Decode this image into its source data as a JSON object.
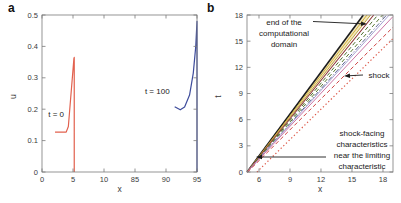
{
  "figure": {
    "axis_color": "#7a7a7a",
    "tick_label_color": "#3a3a3a",
    "annotation_color": "#1a1a1a"
  },
  "chart_data": [
    {
      "id": "panel-a",
      "panel_label": "a",
      "type": "line",
      "xlabel": "x",
      "ylabel": "u",
      "x_axis": {
        "broken": true,
        "tick_values": [
          0,
          5,
          10,
          85,
          90,
          95
        ],
        "tick_labels": [
          "0",
          "5",
          "10",
          "85",
          "90",
          "95"
        ],
        "note": "axis break between 10 and 85, ticks evenly spaced"
      },
      "y_axis": {
        "range": [
          0,
          0.5
        ],
        "tick_values": [
          0,
          0.1,
          0.2,
          0.3,
          0.4,
          0.5
        ],
        "tick_labels": [
          "0",
          "0.1",
          "0.2",
          "0.3",
          "0.4",
          "0.5"
        ]
      },
      "series": [
        {
          "name": "profile-t0",
          "color": "#e2614e",
          "width": 1.2,
          "points": [
            [
              2.1,
              0.127
            ],
            [
              3.9,
              0.127
            ],
            [
              4.25,
              0.145
            ],
            [
              5.15,
              0.362
            ],
            [
              5.2,
              0.365
            ],
            [
              5.2,
              0.0
            ]
          ],
          "label": {
            "text": "t = 0",
            "x": 1.0,
            "y": 0.175
          }
        },
        {
          "name": "profile-t100",
          "color": "#3e4c9c",
          "width": 1.2,
          "points": [
            [
              91.4,
              0.208
            ],
            [
              92.3,
              0.198
            ],
            [
              93.0,
              0.207
            ],
            [
              93.8,
              0.245
            ],
            [
              94.4,
              0.315
            ],
            [
              94.8,
              0.4
            ],
            [
              95.0,
              0.48
            ],
            [
              95.0,
              0.0
            ]
          ],
          "label": {
            "text": "t = 100",
            "x": 86.6,
            "y": 0.248
          }
        }
      ]
    },
    {
      "id": "panel-b",
      "panel_label": "b",
      "type": "line",
      "xlabel": "x",
      "ylabel": "t",
      "x_axis": {
        "broken": false,
        "range": [
          4.84,
          18.97
        ],
        "tick_values": [
          6,
          9,
          12,
          15,
          18
        ],
        "tick_labels": [
          "6",
          "9",
          "12",
          "15",
          "18"
        ]
      },
      "y_axis": {
        "range": [
          0,
          18
        ],
        "tick_values": [
          0,
          3,
          6,
          9,
          12,
          15,
          18
        ],
        "tick_labels": [
          "0",
          "3",
          "6",
          "9",
          "12",
          "15",
          "18"
        ]
      },
      "band": {
        "name": "characteristic-band",
        "fill": "#f2e7bd",
        "points": [
          [
            4.85,
            0
          ],
          [
            16.2,
            18
          ],
          [
            16.8,
            18
          ]
        ]
      },
      "lines": [
        {
          "name": "end-of-domain-characteristic",
          "color": "#1c1c1c",
          "width": 1.6,
          "dash": "",
          "from": [
            4.85,
            0
          ],
          "to": [
            16.1,
            18
          ]
        },
        {
          "name": "gold-characteristic",
          "color": "#d2b13c",
          "width": 1.0,
          "dash": "",
          "from": [
            4.85,
            0
          ],
          "to": [
            16.45,
            18
          ]
        },
        {
          "name": "dark-gold-characteristic",
          "color": "#b89a30",
          "width": 0.9,
          "dash": "",
          "from": [
            4.85,
            0
          ],
          "to": [
            16.8,
            18
          ]
        },
        {
          "name": "maroon-characteristic",
          "color": "#8e3636",
          "width": 1.1,
          "dash": "",
          "from": [
            4.85,
            0
          ],
          "to": [
            17.1,
            18
          ]
        },
        {
          "name": "green-dashed-characteristic-1",
          "color": "#4f7030",
          "width": 1.0,
          "dash": "4 2.6",
          "from": [
            4.85,
            0
          ],
          "to": [
            17.5,
            18
          ]
        },
        {
          "name": "green-dashed-characteristic-2",
          "color": "#5e7c38",
          "width": 1.0,
          "dash": "4 2.6",
          "from": [
            4.85,
            0
          ],
          "to": [
            17.95,
            18
          ]
        },
        {
          "name": "slate-dashdot-characteristic",
          "color": "#5f6b94",
          "width": 1.0,
          "dash": "5 2 1.2 2",
          "from": [
            4.85,
            0
          ],
          "to": [
            18.35,
            18
          ]
        },
        {
          "name": "lavender-characteristic",
          "color": "#a8a0d2",
          "width": 1.0,
          "dash": "",
          "from": [
            4.85,
            0
          ],
          "to": [
            18.6,
            18
          ]
        },
        {
          "name": "magenta-characteristic",
          "color": "#cc74a4",
          "width": 1.0,
          "dash": "",
          "from": [
            4.85,
            0
          ],
          "to": [
            18.95,
            17.8
          ]
        },
        {
          "name": "shock-line",
          "color": "#cf4444",
          "width": 1.0,
          "dash": "4 2.6",
          "from": [
            4.9,
            0
          ],
          "to": [
            18.97,
            16.6
          ]
        },
        {
          "name": "limiting-characteristic",
          "color": "#dd5848",
          "width": 1.2,
          "dash": "1.3 2.4",
          "from": [
            5.8,
            0
          ],
          "to": [
            18.97,
            15.3
          ]
        }
      ],
      "annotations": [
        {
          "name": "end-of-domain-note",
          "lines": [
            "end of the",
            "computational",
            "domain"
          ],
          "cx": 284,
          "y0": 25,
          "lh": 11,
          "arrow": {
            "x1": 313,
            "y1": 21.5,
            "x2": 367,
            "y2": 24
          }
        },
        {
          "name": "shock-note",
          "lines": [
            "shock"
          ],
          "cx": 379,
          "y0": 78,
          "lh": 11,
          "arrow": {
            "x1": 363,
            "y1": 75,
            "x2": 344,
            "y2": 76
          }
        },
        {
          "name": "limiting-characteristic-note",
          "lines": [
            "shock-facing",
            "characteristics",
            "near the limiting",
            "characteristic"
          ],
          "cx": 362,
          "y0": 136,
          "lh": 11,
          "arrow": {
            "x1": 326,
            "y1": 157,
            "x2": 256,
            "y2": 157
          }
        }
      ]
    }
  ]
}
